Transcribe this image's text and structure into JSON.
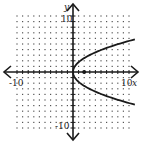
{
  "chart_data": {
    "type": "line",
    "title": "",
    "xlabel": "x",
    "ylabel": "y",
    "xlim": [
      -10,
      10
    ],
    "ylim": [
      -10,
      10
    ],
    "grid": "dotted",
    "tick_labels": {
      "x_min": "-10",
      "x_max": "10",
      "y_min": "-10",
      "y_max": "10"
    },
    "series": [
      {
        "name": "parabola",
        "equation": "y^2 = 8x",
        "vertex": [
          0,
          0
        ],
        "opens": "right",
        "x": [
          0,
          0.5,
          1,
          2,
          4,
          6,
          8,
          10,
          11
        ],
        "y_upper": [
          0,
          2,
          2.83,
          4,
          5.66,
          6.93,
          8,
          8.94,
          9.38
        ]
      }
    ],
    "points": [
      {
        "label": "focus",
        "x": 2,
        "y": 0
      }
    ]
  },
  "labels": {
    "x_axis": "x",
    "y_axis": "y",
    "x_min": "-10",
    "x_max": "10",
    "y_min": "-10",
    "y_max": "10"
  },
  "colors": {
    "curve": "#1a1a1a",
    "grid": "#555555",
    "axis": "#1a1a1a"
  }
}
